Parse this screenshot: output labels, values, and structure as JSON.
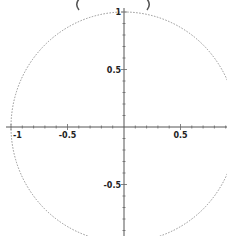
{
  "chart_data": {
    "type": "line",
    "title": "",
    "subtitle_fragment": "( )",
    "xlabel": "",
    "ylabel": "",
    "xlim": [
      -1,
      1
    ],
    "ylim": [
      -1,
      1
    ],
    "grid": false,
    "legend": null,
    "axes_through_origin": true,
    "x_ticks": [
      -1,
      -0.5,
      0.5
    ],
    "x_tick_labels": [
      "-1",
      "-0.5",
      "0.5"
    ],
    "y_ticks": [
      1,
      0.5,
      -0.5
    ],
    "y_tick_labels": [
      "1",
      "0.5",
      "-0.5"
    ],
    "series": [
      {
        "name": "unit circle",
        "equation": "x^2 + y^2 = 1",
        "style": "dotted",
        "color": "#888888",
        "points": [
          [
            1,
            0
          ],
          [
            0.866,
            0.5
          ],
          [
            0.5,
            0.866
          ],
          [
            0,
            1
          ],
          [
            -0.5,
            0.866
          ],
          [
            -0.866,
            0.5
          ],
          [
            -1,
            0
          ],
          [
            -0.866,
            -0.5
          ],
          [
            -0.5,
            -0.866
          ],
          [
            0,
            -1
          ],
          [
            0.5,
            -0.866
          ],
          [
            0.866,
            -0.5
          ]
        ]
      }
    ]
  },
  "layout": {
    "origin_px": [
      124,
      127
    ],
    "unit_px_x": 113,
    "unit_px_y": 115
  }
}
